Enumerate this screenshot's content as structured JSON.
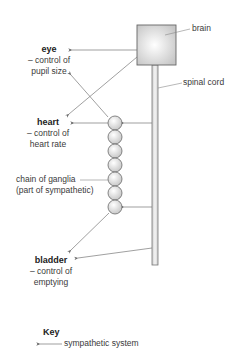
{
  "labels": {
    "brain": "brain",
    "spinal_cord": "spinal cord",
    "eye": {
      "title": "eye",
      "line1": "– control of",
      "line2": "pupil size"
    },
    "heart": {
      "title": "heart",
      "line1": "– control of",
      "line2": "heart rate"
    },
    "ganglia": {
      "line1": "chain of ganglia",
      "line2": "(part of sympathetic)"
    },
    "bladder": {
      "title": "bladder",
      "line1": "– control of",
      "line2": "emptying"
    }
  },
  "key": {
    "title": "Key",
    "items": [
      {
        "symbol": "arrow-left",
        "label": "sympathetic system"
      }
    ]
  },
  "colors": {
    "line": "#777777",
    "brain_fill_center": "#ffffff",
    "brain_fill_edge": "#c8c8c8",
    "ganglion_fill": "#dddddd",
    "spinal_cord_fill": "#d8d8d8"
  },
  "ganglia_count": 7
}
